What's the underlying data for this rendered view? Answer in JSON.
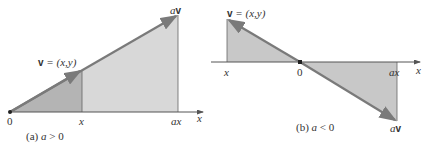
{
  "colors": {
    "vector": "#7a7a7a",
    "axis": "#555555",
    "fill_dark": "#b4b4b4",
    "fill_light": "#d8d8d8",
    "text": "#333333"
  },
  "panel_a": {
    "caption": "(a) a > 0",
    "caption_prefix": "(a) ",
    "caption_var": "a",
    "caption_rel": " > 0",
    "origin_label": "0",
    "x_tick_label": "x",
    "ax_tick_label": "ax",
    "axis_label": "x",
    "v_label_bold": "v",
    "v_label_rest": " = (x,y)",
    "av_label_scalar": "a",
    "av_label_bold": "v"
  },
  "panel_b": {
    "caption": "(b) a < 0",
    "caption_prefix": "(b) ",
    "caption_var": "a",
    "caption_rel": " < 0",
    "origin_label": "0",
    "x_tick_label": "x",
    "ax_tick_label": "ax",
    "axis_label": "x",
    "v_label_bold": "v",
    "v_label_rest": " = (x,y)",
    "av_label_scalar": "a",
    "av_label_bold": "v"
  }
}
